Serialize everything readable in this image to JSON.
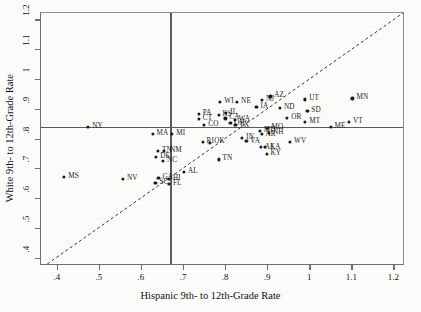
{
  "chart_data": {
    "type": "scatter",
    "title": "",
    "xlabel": "Hispanic 9th- to 12th-Grade Rate",
    "ylabel": "White 9th- to 12th-Grade Rate",
    "xlim": [
      0.36,
      1.225
    ],
    "ylim": [
      0.375,
      1.225
    ],
    "xticks": [
      0.4,
      0.5,
      0.6,
      0.7,
      0.8,
      0.9,
      1.0,
      1.1,
      1.2
    ],
    "xticklabels": [
      ".4",
      ".5",
      ".6",
      ".7",
      ".8",
      ".9",
      "1",
      "1.1",
      "1.2"
    ],
    "yticks": [
      0.4,
      0.5,
      0.6,
      0.7,
      0.8,
      0.9,
      1.0,
      1.1,
      1.2
    ],
    "yticklabels": [
      ".4",
      ".5",
      ".6",
      ".7",
      ".8",
      ".9",
      "1",
      "1.1",
      "1.2"
    ],
    "grid": false,
    "legend": "none",
    "reference_lines": {
      "vertical_x": 0.667,
      "horizontal_y": 0.843,
      "diagonal": "y = x (dashed 45-degree line)"
    },
    "points": [
      {
        "label": "MS",
        "x": 0.415,
        "y": 0.675,
        "lx": 4,
        "ly": -4
      },
      {
        "label": "NV",
        "x": 0.555,
        "y": 0.667,
        "lx": 4,
        "ly": -4
      },
      {
        "label": "NY",
        "x": 0.472,
        "y": 0.843,
        "lx": 4,
        "ly": -4
      },
      {
        "label": "MA",
        "x": 0.625,
        "y": 0.818,
        "lx": 4,
        "ly": -4
      },
      {
        "label": "MI",
        "x": 0.672,
        "y": 0.818,
        "lx": 4,
        "ly": -4
      },
      {
        "label": "TN",
        "x": 0.638,
        "y": 0.762,
        "lx": 4,
        "ly": -4
      },
      {
        "label": "NM",
        "x": 0.652,
        "y": 0.762,
        "lx": 6,
        "ly": -4
      },
      {
        "label": "DE",
        "x": 0.634,
        "y": 0.742,
        "lx": 4,
        "ly": -4
      },
      {
        "label": "NC",
        "x": 0.65,
        "y": 0.727,
        "lx": 4,
        "ly": -4
      },
      {
        "label": "GA",
        "x": 0.639,
        "y": 0.672,
        "lx": 4,
        "ly": -4
      },
      {
        "label": "HI",
        "x": 0.664,
        "y": 0.668,
        "lx": 4,
        "ly": -4
      },
      {
        "label": "SC",
        "x": 0.632,
        "y": 0.655,
        "lx": 4,
        "ly": -4
      },
      {
        "label": "FL",
        "x": 0.664,
        "y": 0.65,
        "lx": 4,
        "ly": -4
      },
      {
        "label": "AL",
        "x": 0.7,
        "y": 0.692,
        "lx": 4,
        "ly": -4
      },
      {
        "label": "PA",
        "x": 0.735,
        "y": 0.885,
        "lx": 4,
        "ly": -4
      },
      {
        "label": "CT",
        "x": 0.735,
        "y": 0.868,
        "lx": 4,
        "ly": -4
      },
      {
        "label": "CO",
        "x": 0.748,
        "y": 0.848,
        "lx": 4,
        "ly": -4
      },
      {
        "label": "RI",
        "x": 0.744,
        "y": 0.792,
        "lx": 4,
        "ly": -4
      },
      {
        "label": "OK",
        "x": 0.762,
        "y": 0.788,
        "lx": 4,
        "ly": -5
      },
      {
        "label": "KS",
        "x": 0.782,
        "y": 0.882,
        "lx": 4,
        "ly": -4
      },
      {
        "label": "IL",
        "x": 0.8,
        "y": 0.89,
        "lx": 4,
        "ly": -4
      },
      {
        "label": "WI",
        "x": 0.786,
        "y": 0.925,
        "lx": 4,
        "ly": -4
      },
      {
        "label": "NE",
        "x": 0.826,
        "y": 0.925,
        "lx": 4,
        "ly": -4
      },
      {
        "label": "CA",
        "x": 0.798,
        "y": 0.871,
        "lx": 4,
        "ly": -4
      },
      {
        "label": "WA",
        "x": 0.82,
        "y": 0.866,
        "lx": 4,
        "ly": -4
      },
      {
        "label": "OH",
        "x": 0.81,
        "y": 0.855,
        "lx": 4,
        "ly": -3
      },
      {
        "label": "TX",
        "x": 0.822,
        "y": 0.85,
        "lx": 4,
        "ly": -3
      },
      {
        "label": "IN",
        "x": 0.838,
        "y": 0.805,
        "lx": 4,
        "ly": -4
      },
      {
        "label": "VA",
        "x": 0.848,
        "y": 0.795,
        "lx": 4,
        "ly": -3
      },
      {
        "label": "MD",
        "x": 0.88,
        "y": 0.828,
        "lx": 4,
        "ly": -4
      },
      {
        "label": "MO",
        "x": 0.898,
        "y": 0.84,
        "lx": 4,
        "ly": -4
      },
      {
        "label": "IA",
        "x": 0.872,
        "y": 0.91,
        "lx": 4,
        "ly": -4
      },
      {
        "label": "AZ",
        "x": 0.905,
        "y": 0.945,
        "lx": 4,
        "ly": -4
      },
      {
        "label": "NJ",
        "x": 0.885,
        "y": 0.932,
        "lx": 4,
        "ly": -4
      },
      {
        "label": "ND",
        "x": 0.928,
        "y": 0.905,
        "lx": 4,
        "ly": -4
      },
      {
        "label": "TN2",
        "x": 0.782,
        "y": 0.733,
        "lx": 4,
        "ly": -4
      },
      {
        "label": "AR",
        "x": 0.884,
        "y": 0.82,
        "lx": 4,
        "ly": -3
      },
      {
        "label": "NH",
        "x": 0.902,
        "y": 0.822,
        "lx": 4,
        "ly": -4
      },
      {
        "label": "AK",
        "x": 0.882,
        "y": 0.775,
        "lx": 4,
        "ly": -3
      },
      {
        "label": "LA",
        "x": 0.892,
        "y": 0.775,
        "lx": 6,
        "ly": -3
      },
      {
        "label": "KY",
        "x": 0.896,
        "y": 0.752,
        "lx": 4,
        "ly": -4
      },
      {
        "label": "WV",
        "x": 0.952,
        "y": 0.792,
        "lx": 4,
        "ly": -4
      },
      {
        "label": "OR",
        "x": 0.945,
        "y": 0.872,
        "lx": 4,
        "ly": -4
      },
      {
        "label": "SD",
        "x": 0.993,
        "y": 0.895,
        "lx": 4,
        "ly": -4
      },
      {
        "label": "UT",
        "x": 0.988,
        "y": 0.935,
        "lx": 4,
        "ly": -4
      },
      {
        "label": "MT",
        "x": 0.988,
        "y": 0.86,
        "lx": 4,
        "ly": -4
      },
      {
        "label": "ME",
        "x": 1.048,
        "y": 0.843,
        "lx": 4,
        "ly": -4
      },
      {
        "label": "VT",
        "x": 1.092,
        "y": 0.858,
        "lx": 4,
        "ly": -4
      },
      {
        "label": "MN",
        "x": 1.1,
        "y": 0.938,
        "lx": 4,
        "ly": -4
      }
    ]
  }
}
